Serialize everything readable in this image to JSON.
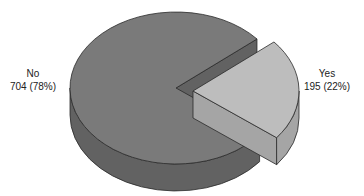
{
  "chart_data": {
    "type": "pie",
    "style": "3d-exploded",
    "title": "",
    "categories": [
      "No",
      "Yes"
    ],
    "values": [
      704,
      195
    ],
    "percentages": [
      78,
      22
    ],
    "labels": [
      {
        "name": "No",
        "value_text": "704 (78%)"
      },
      {
        "name": "Yes",
        "value_text": "195 (22%)"
      }
    ],
    "exploded": [
      "Yes"
    ],
    "colors": {
      "No_top": "#7a7a7a",
      "No_side": "#626262",
      "Yes_top": "#bdbdbd",
      "Yes_side": "#a5a5a5",
      "edge": "#2a2a2a"
    },
    "legend": "none"
  }
}
